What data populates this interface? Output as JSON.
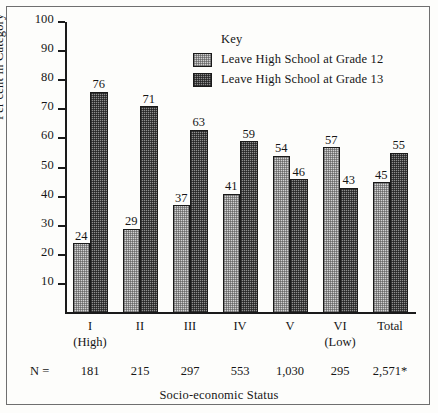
{
  "chart_data": {
    "type": "bar",
    "title": "",
    "xlabel": "Socio-economic Status",
    "ylabel": "Per cent in Category",
    "ylim": [
      0,
      100
    ],
    "yticks": [
      100,
      90,
      80,
      70,
      60,
      50,
      40,
      30,
      20,
      10
    ],
    "grid": false,
    "legend_position": "inside-top-center",
    "legend_title": "Key",
    "categories": [
      "I",
      "II",
      "III",
      "IV",
      "V",
      "VI",
      "Total"
    ],
    "category_sublabels": [
      "(High)",
      "",
      "",
      "",
      "",
      "(Low)",
      ""
    ],
    "series": [
      {
        "name": "Leave High School at Grade 12",
        "style": "light",
        "values": [
          24,
          29,
          37,
          41,
          54,
          57,
          45
        ]
      },
      {
        "name": "Leave High School at Grade 13",
        "style": "dark",
        "values": [
          76,
          71,
          63,
          59,
          46,
          43,
          55
        ]
      }
    ],
    "n_label": "N =",
    "n_values": [
      "181",
      "215",
      "297",
      "553",
      "1,030",
      "295",
      "2,571*"
    ]
  }
}
